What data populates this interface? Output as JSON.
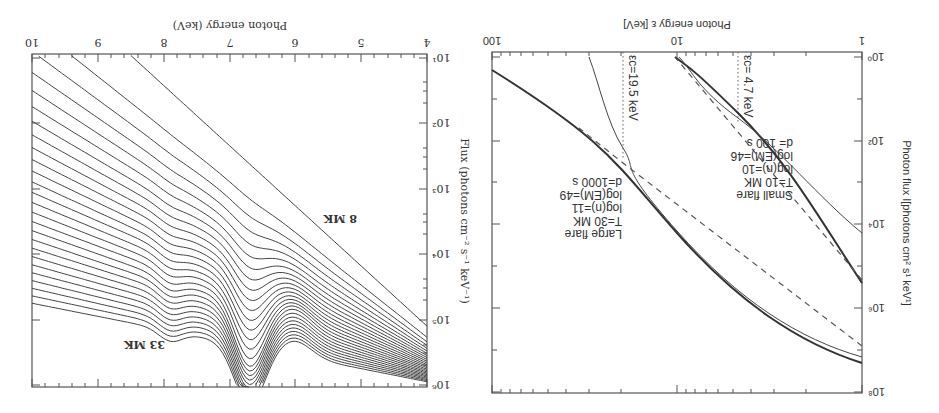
{
  "orientation": "rotated 180 degrees",
  "chart_data": [
    {
      "type": "line",
      "panel": "left-upright (thermal spectra family)",
      "title": "",
      "xlabel": "Photon energy (keV)",
      "ylabel": "Flux (photons cm⁻² s⁻¹ keV⁻¹)",
      "xlim": [
        4,
        10
      ],
      "x_ticks": [
        "4",
        "5",
        "6",
        "7",
        "8",
        "9",
        "10"
      ],
      "y_scale": "log",
      "y_ticks": [
        "10¹",
        "10²",
        "10³",
        "10⁴",
        "10⁵",
        "10⁶"
      ],
      "ylim": [
        10,
        1000000
      ],
      "grid": false,
      "annotations": [
        "8 MK",
        "33 MK"
      ],
      "series_description": "26 thermal spectra from 8 MK (lowest) to 33 MK (highest); Fe line complex bump near 6.7 keV, steeper fall-off at low temperature",
      "series": [
        {
          "name": "8 MK",
          "x": [
            4,
            5,
            6,
            7,
            8,
            9,
            9.2
          ],
          "log10_flux": [
            5.1,
            4.2,
            3.3,
            2.4,
            1.5,
            0.6,
            0.0
          ]
        },
        {
          "name": "~12 MK",
          "x": [
            4,
            5,
            6,
            6.7,
            7,
            8,
            9,
            10
          ],
          "log10_flux": [
            5.5,
            4.9,
            4.2,
            3.7,
            3.3,
            2.3,
            1.4,
            0.5
          ]
        },
        {
          "name": "~18 MK",
          "x": [
            4,
            5,
            6,
            6.7,
            7,
            8,
            9,
            10
          ],
          "log10_flux": [
            5.7,
            5.3,
            4.9,
            4.4,
            4.0,
            3.3,
            2.8,
            2.4
          ]
        },
        {
          "name": "33 MK",
          "x": [
            4,
            5,
            6,
            6.5,
            6.7,
            7,
            7.5,
            8,
            9,
            10
          ],
          "log10_flux": [
            5.95,
            5.7,
            5.5,
            5.7,
            5.95,
            5.8,
            5.1,
            4.7,
            4.5,
            4.3
          ]
        }
      ]
    },
    {
      "type": "line",
      "panel": "right-upright (flare spectra)",
      "title": "",
      "xlabel": "Photon energy  ε [keV]",
      "ylabel": "Photon flux  I[photons cm² s¹ keV¹]",
      "x_scale": "log",
      "xlim": [
        1,
        100
      ],
      "x_ticks": [
        "1",
        "10",
        "100"
      ],
      "y_scale": "log",
      "y_ticks": [
        "10⁰",
        "10²",
        "10⁴",
        "10⁶",
        "10⁸"
      ],
      "ylim": [
        1,
        100000000
      ],
      "grid": false,
      "annotations": [
        {
          "text": "εc= 4.7 keV",
          "x": 4.7
        },
        {
          "text": "εc=19.5 keV",
          "x": 19.5
        },
        {
          "text": [
            "Small flare",
            "T=10 MK",
            "log(n)=10",
            "log(EM)=46",
            "d= 100 s"
          ]
        },
        {
          "text": [
            "Large flare",
            "T=30 MK",
            "log(n)=11",
            "log(EM)=49",
            "d=1000 s"
          ]
        }
      ],
      "series": [
        {
          "name": "Small flare thermal (thick)",
          "x": [
            1,
            2,
            4.7,
            8,
            10
          ],
          "log10_flux": [
            5.4,
            3.6,
            1.5,
            0.4,
            0.0
          ]
        },
        {
          "name": "Small flare thin",
          "x": [
            1,
            2,
            4.7,
            10
          ],
          "log10_flux": [
            4.2,
            3.1,
            1.7,
            0.0
          ]
        },
        {
          "name": "Small flare power-law (dashed)",
          "x": [
            1,
            4.7,
            10
          ],
          "log10_flux": [
            5.3,
            1.6,
            0.0
          ]
        },
        {
          "name": "Large flare thermal (thick)",
          "x": [
            1,
            2,
            5,
            10,
            19.5,
            50,
            100
          ],
          "log10_flux": [
            7.3,
            6.6,
            5.4,
            4.1,
            2.6,
            1.0,
            0.3
          ]
        },
        {
          "name": "Large flare thin",
          "x": [
            1,
            2,
            10,
            19.5,
            30
          ],
          "log10_flux": [
            7.1,
            6.5,
            4.1,
            2.7,
            0.0
          ]
        },
        {
          "name": "Large flare power-law (dashed)",
          "x": [
            1,
            19.5,
            30
          ],
          "log10_flux": [
            6.8,
            2.6,
            2.1
          ]
        }
      ]
    }
  ],
  "left": {
    "xlabel": "Photon energy (keV)",
    "ylabel": "Flux (photons cm⁻² s⁻¹ keV⁻¹)",
    "xticks": [
      "4",
      "5",
      "6",
      "7",
      "8",
      "9",
      "10"
    ],
    "yticks": [
      "10¹",
      "10²",
      "10³",
      "10⁴",
      "10⁵",
      "10⁶"
    ],
    "label_low": "8 MK",
    "label_high": "33 MK"
  },
  "right": {
    "xlabel": "Photon energy  ε [keV]",
    "ylabel": "Photon flux  I[photons cm² s¹ keV¹]",
    "xticks": [
      "1",
      "10",
      "100"
    ],
    "yticks": [
      "10⁰",
      "10²",
      "10⁴",
      "10⁶",
      "10⁸"
    ],
    "ec_small": "εc= 4.7 keV",
    "ec_large": "εc=19.5 keV",
    "small": [
      "Small flare",
      "T=10 MK",
      "log(n)=10",
      "log(EM)=46",
      "d= 100 s"
    ],
    "large": [
      "Large flare",
      "T=30 MK",
      "log(n)=11",
      "log(EM)=49",
      "d=1000 s"
    ]
  }
}
